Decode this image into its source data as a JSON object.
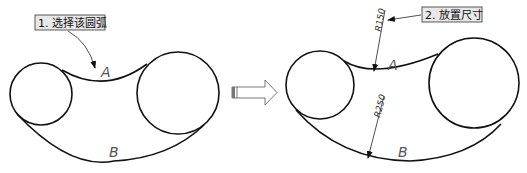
{
  "diagram": {
    "type": "before-after CAD dimensioning illustration",
    "steps": [
      {
        "label": "1. 选择该圆弧",
        "meaning": "Select this arc"
      },
      {
        "label": "2. 放置尺寸",
        "meaning": "Place dimension"
      }
    ],
    "arc_labels": {
      "top": "A",
      "bottom": "B"
    },
    "dimensions": {
      "top_radius": "R150",
      "bottom_radius": "R250"
    },
    "transition_icon": "right-arrow-icon",
    "colors": {
      "stroke": "#111111",
      "label_box_fill": "#e8e8e8",
      "label_text": "#111111"
    }
  }
}
